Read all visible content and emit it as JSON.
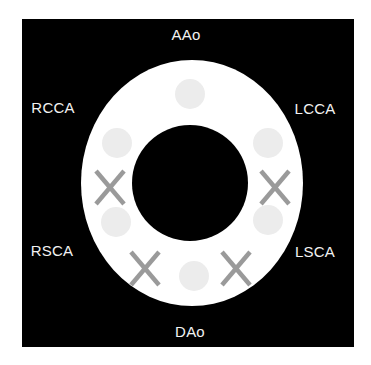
{
  "diagram": {
    "colors": {
      "background": "#000000",
      "ring": "#ffffff",
      "dot": "#ececec",
      "cross": "#9a9a9a",
      "label": "#f2f2f2"
    },
    "labels": {
      "top": "AAo",
      "bottom": "DAo",
      "upper_left": "RCCA",
      "upper_right": "LCCA",
      "lower_left": "RSCA",
      "lower_right": "LSCA"
    },
    "markers": [
      {
        "type": "dot",
        "position": "top"
      },
      {
        "type": "dot",
        "position": "upper-left"
      },
      {
        "type": "dot",
        "position": "upper-right"
      },
      {
        "type": "cross",
        "symbol": "X",
        "position": "left"
      },
      {
        "type": "cross",
        "symbol": "X",
        "position": "right"
      },
      {
        "type": "dot",
        "position": "lower-left"
      },
      {
        "type": "dot",
        "position": "lower-right"
      },
      {
        "type": "cross",
        "symbol": "X",
        "position": "bottom-left"
      },
      {
        "type": "dot",
        "position": "bottom"
      },
      {
        "type": "cross",
        "symbol": "X",
        "position": "bottom-right"
      }
    ]
  }
}
